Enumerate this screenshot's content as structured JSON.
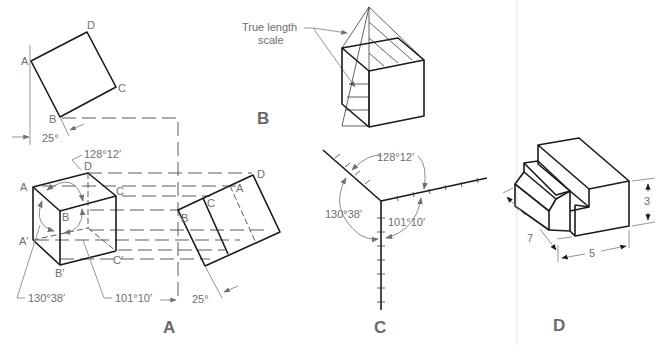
{
  "figure": {
    "panels": [
      {
        "id": "A",
        "caption": "A",
        "top_view_labels": {
          "a": "A",
          "b": "B",
          "c": "C",
          "d": "D"
        },
        "angle_top": "25°",
        "cube_labels": {
          "a": "A",
          "b": "B",
          "c": "C",
          "d": "D",
          "a_prime": "A′",
          "b_prime": "B′",
          "c_prime": "C′"
        },
        "angles": {
          "top": "128°12′",
          "left": "130°38′",
          "right": "101°10′"
        },
        "aux_view_labels": {
          "a": "A",
          "b": "B",
          "c": "C",
          "d": "D"
        },
        "angle_bottom": "25°"
      },
      {
        "id": "B",
        "caption": "B",
        "note": "True length\nscale",
        "note_line1": "True length",
        "note_line2": "scale"
      },
      {
        "id": "C",
        "caption": "C",
        "angles": {
          "top": "128°12′",
          "left": "130°38′",
          "right": "101°10′"
        }
      },
      {
        "id": "D",
        "caption": "D",
        "dimensions": {
          "height": "3",
          "depth": "7",
          "width": "5"
        }
      }
    ]
  }
}
